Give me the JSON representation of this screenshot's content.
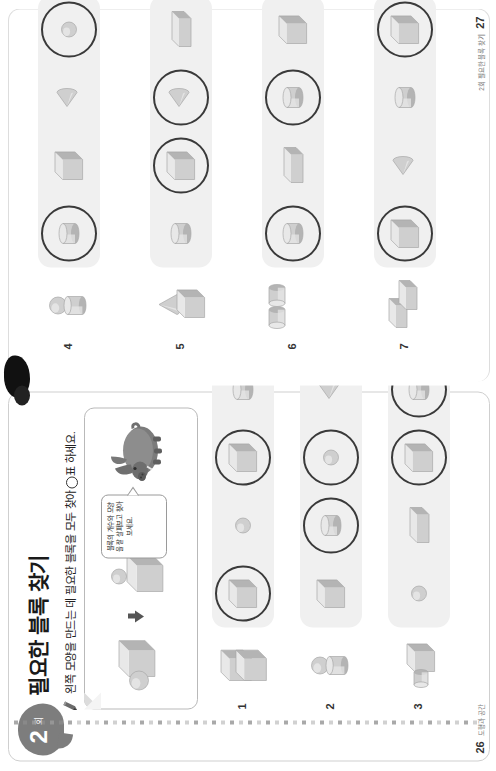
{
  "worksheet": {
    "unit_number": "2",
    "unit_word": "회",
    "title": "필요한 블록 찾기",
    "instruction_before": "왼쪽 모양을 만드는 데 필요한 블록을 모두 찾아",
    "instruction_after": "표 하세요.",
    "pencil_icon": "pencil-icon",
    "circle_mark_icon": "circle-mark-icon"
  },
  "example": {
    "combined_label": "구와 직육면체가 붙은 모양",
    "arrow_icon": "down-arrow-icon",
    "parts_label": "직육면체와 구",
    "bubble_text": "블록의 개수와 모양을 잘 살펴보고 찾아 보세요.",
    "mascot_icon": "boar-mascot-icon"
  },
  "pages": {
    "left_number": "26",
    "left_footer": "도형과 공간",
    "right_number": "27",
    "right_footer": "2회 필요한 블록 찾기"
  },
  "problems": [
    {
      "number": "1",
      "target": "cube-stack",
      "target_desc": "정육면체 2개를 위아래로 쌓은 모양",
      "options": [
        {
          "shape": "cube",
          "circled": true
        },
        {
          "shape": "sphere",
          "circled": false
        },
        {
          "shape": "cube",
          "circled": true
        },
        {
          "shape": "cylinder",
          "circled": false
        }
      ]
    },
    {
      "number": "2",
      "target": "sphere-on-cylinder",
      "target_desc": "원기둥 위에 구가 올려진 모양",
      "options": [
        {
          "shape": "cube",
          "circled": false
        },
        {
          "shape": "cylinder",
          "circled": true
        },
        {
          "shape": "sphere",
          "circled": true
        },
        {
          "shape": "cone",
          "circled": false
        }
      ]
    },
    {
      "number": "3",
      "target": "cylinder-and-box",
      "target_desc": "원기둥과 직육면체가 붙은 모양",
      "options": [
        {
          "shape": "sphere",
          "circled": false
        },
        {
          "shape": "box",
          "circled": false
        },
        {
          "shape": "cube",
          "circled": true
        },
        {
          "shape": "cylinder",
          "circled": true
        }
      ]
    },
    {
      "number": "4",
      "target": "sphere-on-cylinder",
      "target_desc": "원기둥 위에 구가 올려진 모양",
      "options": [
        {
          "shape": "cylinder",
          "circled": true
        },
        {
          "shape": "cube",
          "circled": false
        },
        {
          "shape": "cone",
          "circled": false
        },
        {
          "shape": "sphere",
          "circled": true
        }
      ]
    },
    {
      "number": "5",
      "target": "cone-on-cube",
      "target_desc": "정육면체 위에 원뿔이 올려진 모양",
      "options": [
        {
          "shape": "cylinder",
          "circled": false
        },
        {
          "shape": "cube",
          "circled": true
        },
        {
          "shape": "cone",
          "circled": true
        },
        {
          "shape": "box",
          "circled": false
        }
      ]
    },
    {
      "number": "6",
      "target": "two-cylinders",
      "target_desc": "원기둥 2개가 옆으로 붙은 모양",
      "options": [
        {
          "shape": "cylinder",
          "circled": true
        },
        {
          "shape": "box",
          "circled": false
        },
        {
          "shape": "cylinder",
          "circled": true
        },
        {
          "shape": "cube",
          "circled": false
        }
      ]
    },
    {
      "number": "7",
      "target": "two-boxes-l",
      "target_desc": "직육면체 2개가 ㄱ자로 붙은 모양",
      "options": [
        {
          "shape": "cube",
          "circled": true
        },
        {
          "shape": "cone",
          "circled": false
        },
        {
          "shape": "cylinder",
          "circled": false
        },
        {
          "shape": "cube",
          "circled": true
        }
      ]
    }
  ],
  "colors": {
    "shape_light": "#e8e8e8",
    "shape_mid": "#cfcfcf",
    "shape_dark": "#b4b4b4",
    "ring": "#3a3a3a",
    "optbar_bg": "#f0f0f0",
    "badge": "#7d7d7d"
  }
}
